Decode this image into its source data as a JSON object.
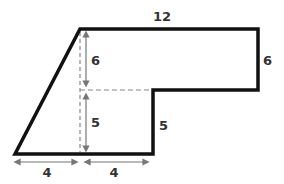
{
  "diagram": {
    "type": "composite-shape",
    "colors": {
      "outline": "#111111",
      "dashed": "#888888",
      "arrow": "#777777",
      "text": "#333333"
    },
    "labels": {
      "top": "12",
      "right_upper": "6",
      "right_lower": "5",
      "inner_upper": "6",
      "inner_lower": "5",
      "bottom_left": "4",
      "bottom_right": "4"
    }
  }
}
